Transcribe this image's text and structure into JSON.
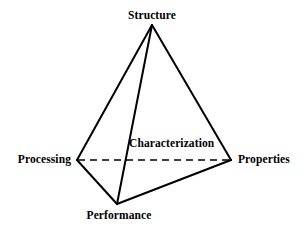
{
  "figure": {
    "name": "materials-science-tetrahedron",
    "background_color": "#ffffff",
    "stroke_color": "#000000",
    "width": 304,
    "height": 232,
    "vertices": {
      "structure": {
        "label": "Structure",
        "x": 152,
        "y": 25
      },
      "processing": {
        "label": "Processing",
        "x": 77,
        "y": 160
      },
      "properties": {
        "label": "Properties",
        "x": 231,
        "y": 160
      },
      "performance": {
        "label": "Performance",
        "x": 117,
        "y": 204
      }
    },
    "interior": {
      "characterization": {
        "label": "Characterization",
        "x": 129,
        "y": 138
      }
    },
    "edges": [
      {
        "name": "structure-processing",
        "from": "structure",
        "to": "processing",
        "style": "solid",
        "width": 2
      },
      {
        "name": "structure-properties",
        "from": "structure",
        "to": "properties",
        "style": "solid",
        "width": 2
      },
      {
        "name": "structure-performance",
        "from": "structure",
        "to": "performance",
        "style": "solid",
        "width": 2
      },
      {
        "name": "processing-performance",
        "from": "processing",
        "to": "performance",
        "style": "solid",
        "width": 2
      },
      {
        "name": "performance-properties",
        "from": "performance",
        "to": "properties",
        "style": "solid",
        "width": 2
      },
      {
        "name": "processing-properties",
        "from": "processing",
        "to": "properties",
        "style": "dashed",
        "width": 1.6,
        "dash_pattern": "7 5"
      }
    ]
  }
}
